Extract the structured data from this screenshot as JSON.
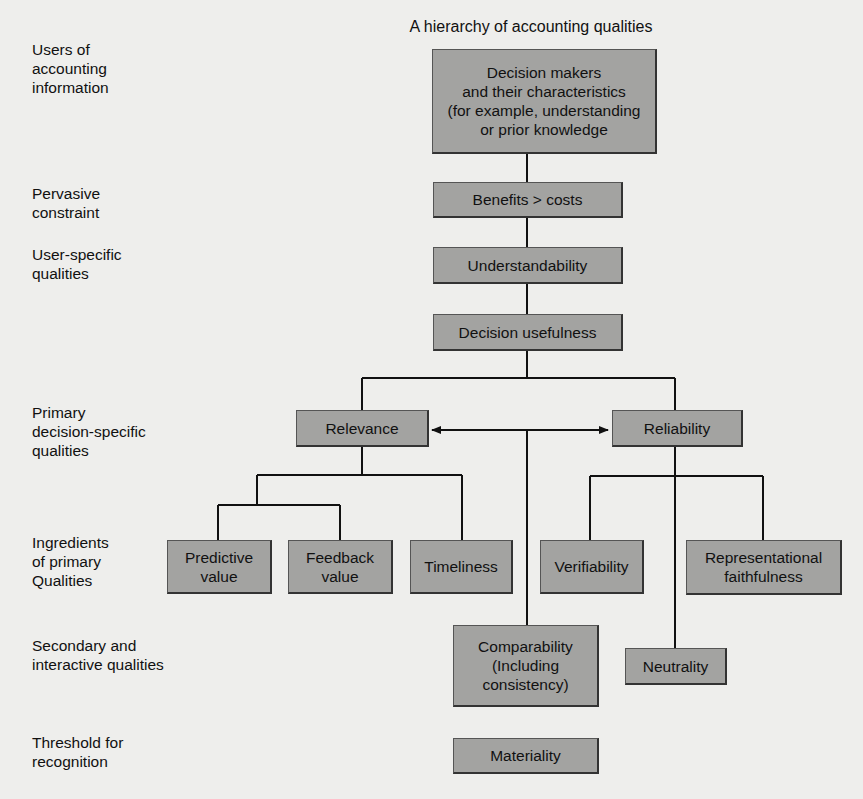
{
  "title": "A hierarchy of accounting qualities",
  "level_labels": [
    {
      "id": "users",
      "text": "Users of\naccounting\ninformation"
    },
    {
      "id": "pervasive",
      "text": "Pervasive\nconstraint"
    },
    {
      "id": "user-specific",
      "text": "User-specific\nqualities"
    },
    {
      "id": "primary",
      "text": "Primary\ndecision-specific\nqualities"
    },
    {
      "id": "ingredients",
      "text": "Ingredients\nof primary\nQualities"
    },
    {
      "id": "secondary",
      "text": "Secondary and\ninteractive qualities"
    },
    {
      "id": "threshold",
      "text": "Threshold for\nrecognition"
    }
  ],
  "nodes": {
    "decision_makers": "Decision makers\nand their characteristics\n(for example, understanding\nor prior knowledge",
    "benefits_costs": "Benefits > costs",
    "understandability": "Understandability",
    "decision_usefulness": "Decision usefulness",
    "relevance": "Relevance",
    "reliability": "Reliability",
    "predictive_value": "Predictive\nvalue",
    "feedback_value": "Feedback\nvalue",
    "timeliness": "Timeliness",
    "verifiability": "Verifiability",
    "representational_faithfulness": "Representational\nfaithfulness",
    "comparability": "Comparability\n(Including\nconsistency)",
    "neutrality": "Neutrality",
    "materiality": "Materiality"
  },
  "colors": {
    "box_fill": "#a3a3a1",
    "line": "#111111",
    "background": "#eeeeec"
  }
}
